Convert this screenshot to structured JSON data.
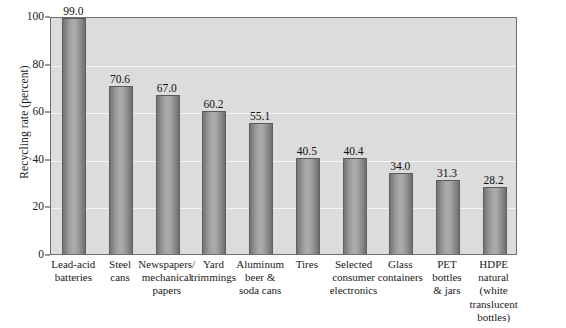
{
  "chart_data": {
    "type": "bar",
    "title": "",
    "xlabel": "",
    "ylabel": "Recycling rate (percent)",
    "ylim": [
      0,
      100
    ],
    "yticks": [
      0,
      20,
      40,
      60,
      80,
      100
    ],
    "grid": true,
    "legend": "none",
    "orientation": "vertical",
    "categories": [
      "Lead-acid batteries",
      "Steel cans",
      "Newspapers/ mechanical papers",
      "Yard trimmings",
      "Aluminum beer & soda cans",
      "Tires",
      "Selected consumer electronics",
      "Glass containers",
      "PET bottles & jars",
      "HDPE natural (white translucent bottles)"
    ],
    "category_lines": [
      [
        "Lead-acid",
        "batteries"
      ],
      [
        "Steel",
        "cans"
      ],
      [
        "Newspapers/",
        "mechanical",
        "papers"
      ],
      [
        "Yard",
        "trimmings"
      ],
      [
        "Aluminum",
        "beer &",
        "soda cans"
      ],
      [
        "Tires"
      ],
      [
        "Selected",
        "consumer",
        "electronics"
      ],
      [
        "Glass",
        "containers"
      ],
      [
        "PET",
        "bottles",
        "& jars"
      ],
      [
        "HDPE",
        "natural",
        "(white",
        "translucent",
        "bottles)"
      ]
    ],
    "values": [
      99.0,
      70.6,
      67.0,
      60.2,
      55.1,
      40.5,
      40.4,
      34.0,
      31.3,
      28.2
    ],
    "value_labels": [
      "99.0",
      "70.6",
      "67.0",
      "60.2",
      "55.1",
      "40.5",
      "40.4",
      "34.0",
      "31.3",
      "28.2"
    ],
    "ytick_labels": [
      "0",
      "20",
      "40",
      "60",
      "80",
      "100"
    ],
    "colors": {
      "plot_background": "#dcdcdc",
      "figure_background": "#ffffff",
      "bar_fill_dark": "#737373",
      "bar_fill_light": "#ababab",
      "gridline": "#f4f4f4",
      "axis": "#6e6e6e",
      "text": "#1a1a1a"
    }
  }
}
